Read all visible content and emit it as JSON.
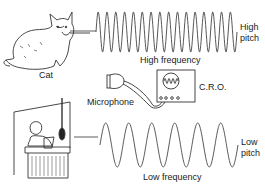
{
  "diagram": {
    "top_cutoff_text": "Pitch and frequency",
    "labels": {
      "cat": "Cat",
      "high_frequency": "High frequency",
      "high_pitch_line1": "High",
      "high_pitch_line2": "pitch",
      "microphone": "Microphone",
      "cro": "C.R.O.",
      "low_frequency": "Low frequency",
      "low_pitch_line1": "Low",
      "low_pitch_line2": "pitch"
    },
    "waves": {
      "high": {
        "cycles": 16,
        "x_start": 96,
        "x_end": 237,
        "y_top": 12,
        "y_bottom": 52
      },
      "low": {
        "cycles": 6,
        "x_start": 100,
        "x_end": 238,
        "y_top": 123,
        "y_bottom": 167
      }
    },
    "colors": {
      "ink": "#333333",
      "background": "#ffffff"
    }
  }
}
